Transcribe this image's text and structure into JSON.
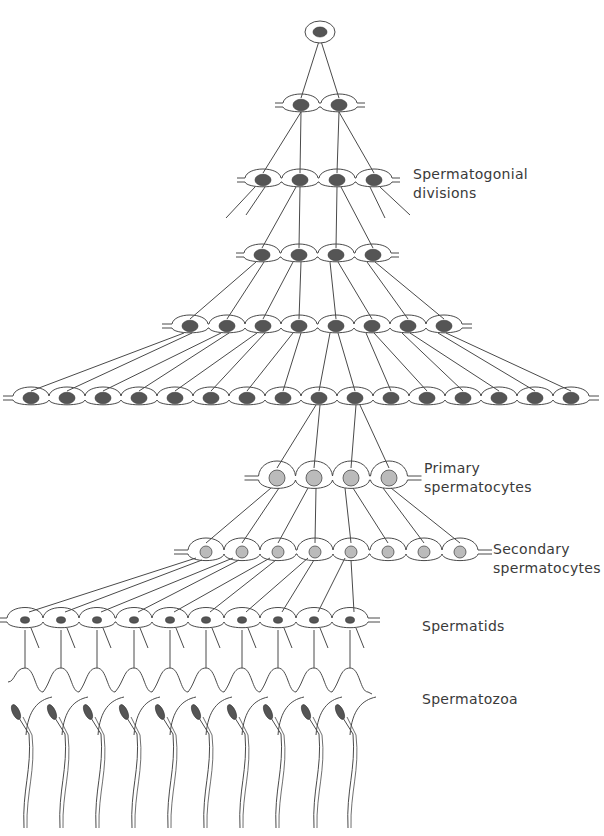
{
  "labels": {
    "spermatogonial": {
      "line1": "Spermatogonial",
      "line2": "divisions"
    },
    "primary": {
      "line1": "Primary",
      "line2": "spermatocytes"
    },
    "secondary": {
      "line1": "Secondary",
      "line2": "spermatocytes"
    },
    "spermatids": {
      "line1": "Spermatids"
    },
    "spermatozoa": {
      "line1": "Spermatozoa"
    }
  },
  "colors": {
    "line": "#4a4a4a",
    "nucleus_dark": "#555555",
    "nucleus_light": "#bbbbbb",
    "text": "#3a3a3a",
    "background": "#ffffff"
  },
  "rows": [
    {
      "name": "spermatogonia-1",
      "stage": "spermatogonium",
      "y": 32,
      "xs": [
        320
      ]
    },
    {
      "name": "spermatogonia-2",
      "stage": "spermatogonium",
      "y": 105,
      "xs": [
        301,
        339
      ]
    },
    {
      "name": "spermatogonia-4a",
      "stage": "spermatogonium",
      "y": 180,
      "xs": [
        263,
        300,
        337,
        374
      ]
    },
    {
      "name": "spermatogonia-4b",
      "stage": "spermatogonium",
      "y": 255,
      "xs": [
        262,
        299,
        336,
        373
      ]
    },
    {
      "name": "spermatogonia-8",
      "stage": "spermatogonium",
      "y": 326,
      "xs": [
        190,
        227,
        263,
        299,
        336,
        372,
        408,
        444
      ]
    },
    {
      "name": "spermatogonia-16",
      "stage": "spermatogonium",
      "y": 398,
      "xs": [
        31,
        67,
        103,
        139,
        175,
        211,
        247,
        283,
        319,
        355,
        391,
        427,
        463,
        499,
        535,
        571
      ]
    },
    {
      "name": "primary-spermatocytes",
      "stage": "primary",
      "y": 478,
      "xs": [
        277,
        314,
        351,
        389
      ]
    },
    {
      "name": "secondary-spermatocytes",
      "stage": "secondary",
      "y": 552,
      "xs": [
        206,
        242,
        278,
        315,
        351,
        388,
        424,
        460
      ]
    },
    {
      "name": "spermatids",
      "stage": "spermatid",
      "y": 620,
      "xs": [
        25,
        61,
        97,
        134,
        170,
        206,
        242,
        278,
        314,
        350
      ]
    },
    {
      "name": "spermatozoa",
      "stage": "spermatozoon",
      "y": 700,
      "xs": [
        16,
        52,
        88,
        124,
        160,
        196,
        232,
        268,
        306,
        340
      ]
    }
  ]
}
